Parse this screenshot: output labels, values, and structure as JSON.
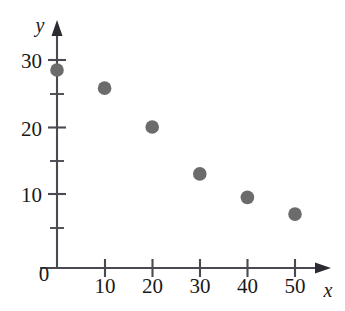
{
  "chart_data": {
    "type": "scatter",
    "title": "",
    "subtitle": "",
    "xlabel": "x",
    "ylabel": "y",
    "origin_label": "0",
    "x": [
      0,
      10,
      20,
      30,
      40,
      50
    ],
    "values": [
      28.5,
      25.8,
      20,
      13,
      9.5,
      7
    ],
    "points": [
      {
        "x": 0,
        "y": 28.5
      },
      {
        "x": 10,
        "y": 25.8
      },
      {
        "x": 20,
        "y": 20
      },
      {
        "x": 30,
        "y": 13
      },
      {
        "x": 40,
        "y": 9.5
      },
      {
        "x": 50,
        "y": 7
      }
    ],
    "xlim": [
      0,
      56
    ],
    "ylim": [
      0,
      33
    ],
    "x_tick_labels": [
      "10",
      "20",
      "30",
      "40",
      "50"
    ],
    "x_ticks": [
      10,
      20,
      30,
      40,
      50
    ],
    "y_tick_labels": [
      "10",
      "20",
      "30"
    ],
    "y_ticks": [
      10,
      20,
      30
    ],
    "y_minor_ticks": [
      5,
      15,
      25
    ],
    "grid": false,
    "legend": null,
    "legend_position": "none",
    "marker_color": "#6b6b6b",
    "axis_color": "#4a4a52",
    "text_color": "#1a1a1a",
    "background_color": "#ffffff",
    "axis_arrows": true
  },
  "axes": {
    "y_axis_name": "y",
    "x_axis_name": "x",
    "origin": "0"
  },
  "x_tick_labels": [
    {
      "label": "10"
    },
    {
      "label": "20"
    },
    {
      "label": "30"
    },
    {
      "label": "40"
    },
    {
      "label": "50"
    }
  ],
  "y_tick_labels": [
    {
      "label": "30"
    },
    {
      "label": "20"
    },
    {
      "label": "10"
    }
  ]
}
